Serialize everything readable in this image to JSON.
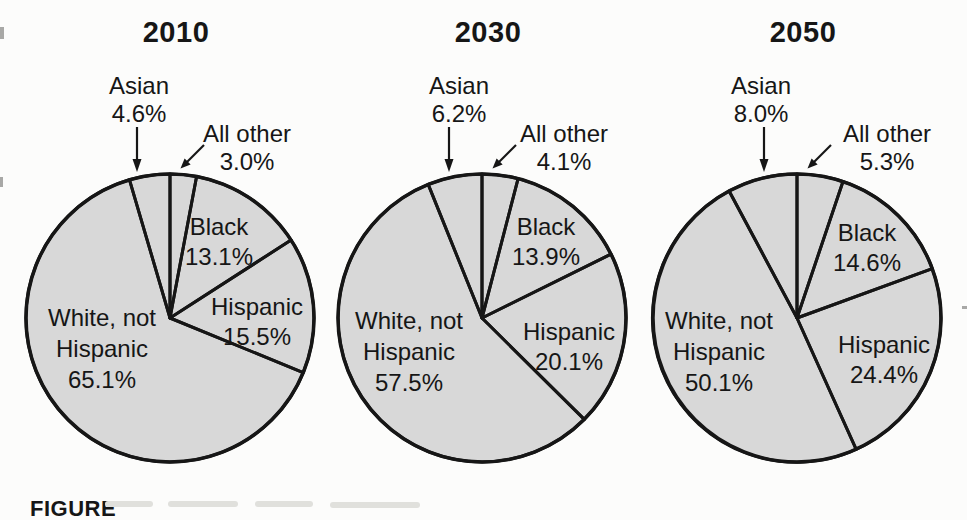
{
  "page": {
    "background": "#fcfcfb",
    "caption_prefix": "FIGURE"
  },
  "icons": {
    "asian_arrow": "down-arrow",
    "all_other_arrow": "down-left-diagonal-arrow"
  },
  "chart_data": [
    {
      "type": "pie",
      "title": "2010",
      "direction": "clockwise",
      "start_angle_deg": 0,
      "fill": "#d8d8d8",
      "stroke": "#161616",
      "slices": [
        {
          "name": "All other",
          "pct": 3.0,
          "value_label": "3.0%"
        },
        {
          "name": "Black",
          "pct": 13.1,
          "value_label": "13.1%"
        },
        {
          "name": "Hispanic",
          "pct": 15.5,
          "value_label": "15.5%"
        },
        {
          "name": "White, not Hispanic",
          "pct": 65.1,
          "value_label": "65.1%",
          "label_line1": "White, not",
          "label_line2": "Hispanic"
        },
        {
          "name": "Asian",
          "pct": 4.6,
          "value_label": "4.6%"
        }
      ]
    },
    {
      "type": "pie",
      "title": "2030",
      "direction": "clockwise",
      "start_angle_deg": 0,
      "fill": "#d8d8d8",
      "stroke": "#161616",
      "slices": [
        {
          "name": "All other",
          "pct": 4.1,
          "value_label": "4.1%"
        },
        {
          "name": "Black",
          "pct": 13.9,
          "value_label": "13.9%"
        },
        {
          "name": "Hispanic",
          "pct": 20.1,
          "value_label": "20.1%"
        },
        {
          "name": "White, not Hispanic",
          "pct": 57.5,
          "value_label": "57.5%",
          "label_line1": "White, not",
          "label_line2": "Hispanic"
        },
        {
          "name": "Asian",
          "pct": 6.2,
          "value_label": "6.2%"
        }
      ]
    },
    {
      "type": "pie",
      "title": "2050",
      "direction": "clockwise",
      "start_angle_deg": 0,
      "fill": "#d8d8d8",
      "stroke": "#161616",
      "slices": [
        {
          "name": "All other",
          "pct": 5.3,
          "value_label": "5.3%"
        },
        {
          "name": "Black",
          "pct": 14.6,
          "value_label": "14.6%"
        },
        {
          "name": "Hispanic",
          "pct": 24.4,
          "value_label": "24.4%"
        },
        {
          "name": "White, not Hispanic",
          "pct": 50.1,
          "value_label": "50.1%",
          "label_line1": "White, not",
          "label_line2": "Hispanic"
        },
        {
          "name": "Asian",
          "pct": 8.0,
          "value_label": "8.0%"
        }
      ]
    }
  ]
}
